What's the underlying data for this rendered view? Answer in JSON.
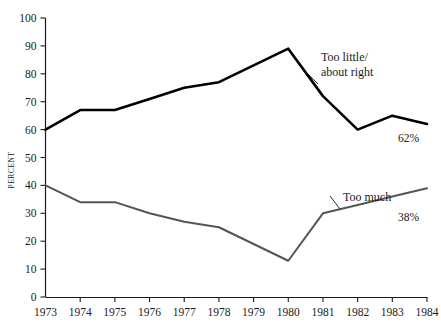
{
  "chart_data": {
    "type": "line",
    "title": "",
    "xlabel": "",
    "ylabel": "PERCENT",
    "xlim": [
      1973,
      1984
    ],
    "ylim": [
      0,
      100
    ],
    "grid": false,
    "legend_position": "inline-annotations",
    "categories": [
      "1973",
      "1974",
      "1975",
      "1976",
      "1977",
      "1978",
      "1979",
      "1980",
      "1981",
      "1982",
      "1983",
      "1984"
    ],
    "x": [
      1973,
      1974,
      1975,
      1976,
      1977,
      1978,
      1979,
      1980,
      1981,
      1982,
      1983,
      1984
    ],
    "yticks": [
      "0",
      "10",
      "20",
      "30",
      "40",
      "50",
      "60",
      "70",
      "80",
      "90",
      "100"
    ],
    "ytick_values": [
      0,
      10,
      20,
      30,
      40,
      50,
      60,
      70,
      80,
      90,
      100
    ],
    "series": [
      {
        "name": "Too little/ about right",
        "color": "#000000",
        "width": 2.6,
        "values": [
          60,
          67,
          67,
          71,
          75,
          77,
          83,
          89,
          72,
          60,
          65,
          62
        ],
        "end_label": "62%",
        "annotation": {
          "line1": "Too little/",
          "line2": "about right"
        }
      },
      {
        "name": "Too much",
        "color": "#555555",
        "width": 2.0,
        "values": [
          40,
          34,
          34,
          30,
          27,
          25,
          19,
          13,
          30,
          33,
          36,
          39
        ],
        "end_label": "38%",
        "annotation": {
          "line1": "Too much",
          "line2": ""
        }
      }
    ]
  },
  "axis": {
    "y_title": "PERCENT"
  }
}
